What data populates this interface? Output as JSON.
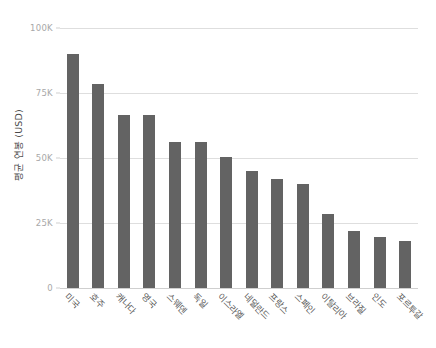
{
  "chart_data": {
    "type": "bar",
    "title": "",
    "subtitle": "",
    "xlabel": "",
    "ylabel": "평균 연봉 (USD)",
    "ylim": [
      0,
      100000
    ],
    "grid": true,
    "legend": false,
    "legend_position": "none",
    "orientation": "vertical",
    "bar_color": "#636363",
    "categories": [
      "미국",
      "호주",
      "캐나다",
      "영국",
      "스웨덴",
      "독일",
      "이스라엘",
      "네덜란드",
      "프랑스",
      "스페인",
      "이탈리아",
      "브라질",
      "인도",
      "포르투갈"
    ],
    "values": [
      90000,
      78500,
      66500,
      66500,
      56000,
      56000,
      50500,
      45000,
      42000,
      40000,
      28500,
      22000,
      19500,
      18000
    ],
    "yticks": [
      0,
      25000,
      50000,
      75000,
      100000
    ],
    "ytick_labels": [
      "0",
      "25K",
      "50K",
      "75K",
      "100K"
    ]
  },
  "axes": {
    "y_title": "평균 연봉 (USD)"
  },
  "style": {
    "background": "#ffffff",
    "gridline_color": "#dedede",
    "tick_text_color": "#a8a8a8",
    "label_text_color": "#5a5a5a"
  }
}
